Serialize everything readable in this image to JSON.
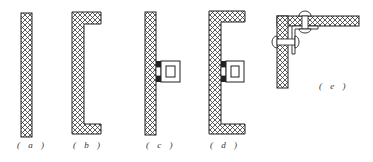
{
  "figure": {
    "panels": [
      {
        "id": "a",
        "label": "( a )",
        "description": "flat panel section"
      },
      {
        "id": "b",
        "label": "( b )",
        "description": "C-channel panel section"
      },
      {
        "id": "c",
        "label": "( c )",
        "description": "flat panel with clip fastener"
      },
      {
        "id": "d",
        "label": "( d )",
        "description": "C-channel panel with clip fastener"
      },
      {
        "id": "e",
        "label": "( e )",
        "description": "corner joint with rivets"
      }
    ],
    "colors": {
      "stroke": "#222222",
      "hatch": "#333333",
      "background": "#ffffff"
    }
  }
}
